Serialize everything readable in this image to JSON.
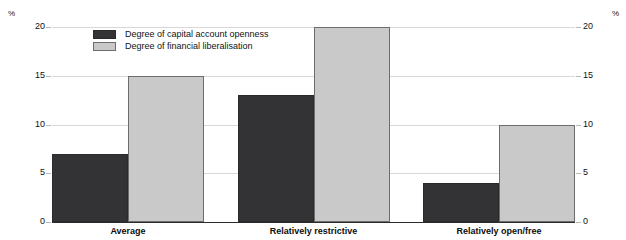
{
  "chart_data": {
    "type": "bar",
    "title": "",
    "xlabel": "",
    "ylabel": "%",
    "ylabel_right": "%",
    "ylim": [
      0,
      20
    ],
    "yticks": [
      0,
      5,
      10,
      15,
      20
    ],
    "grid": true,
    "legend_position": "top-left-inside",
    "categories": [
      "Average",
      "Relatively restrictive",
      "Relatively open/free"
    ],
    "series": [
      {
        "name": "Degree of capital account openness",
        "color": "#333336",
        "values": [
          7,
          13,
          4
        ]
      },
      {
        "name": "Degree of financial liberalisation",
        "color": "#c9c9c9",
        "values": [
          15,
          20,
          10
        ]
      }
    ]
  },
  "axes": {
    "unit_left": "%",
    "unit_right": "%",
    "tick_labels": [
      "20",
      "15",
      "10",
      "5",
      "0"
    ]
  },
  "legend": {
    "items": [
      {
        "label": "Degree of capital account openness",
        "swatch": "dark"
      },
      {
        "label": "Degree of financial liberalisation",
        "swatch": "light"
      }
    ]
  }
}
